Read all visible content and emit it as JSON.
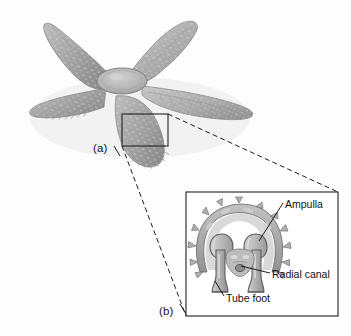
{
  "figure": {
    "background_color": "#fdfdfd",
    "ink_color": "#1a1a1a",
    "organism_fill": "#a9a9a9",
    "organism_shade": "#8d8d8d",
    "organism_highlight": "#c6c6c6"
  },
  "panels": {
    "a": {
      "label": "(a)",
      "description": "whole sea star, aboral view, five arms",
      "arm_count": 5
    },
    "b": {
      "label": "(b)",
      "description": "magnified transverse section through arm"
    }
  },
  "callouts": [
    {
      "id": "ampulla",
      "label": "Ampulla"
    },
    {
      "id": "radial-canal",
      "label": "Radial canal"
    },
    {
      "id": "tube-foot",
      "label": "Tube foot"
    }
  ],
  "structures": {
    "selection_box": {
      "x": 122,
      "y": 114,
      "width": 46,
      "height": 32
    },
    "inset_box": {
      "x": 186,
      "y": 192,
      "width": 152,
      "height": 124
    }
  }
}
